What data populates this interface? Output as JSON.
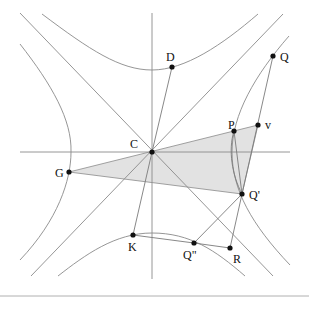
{
  "diagram": {
    "type": "conjugate hyperbolas with asymptotes and shaded triangle",
    "colors": {
      "background": "#ffffff",
      "lines": "#8a8a8a",
      "points": "#111111",
      "shaded_triangle": "#e2e2e2"
    },
    "points": [
      {
        "id": "C",
        "label": "C",
        "x": 152,
        "y": 152,
        "lx": 130,
        "ly": 148
      },
      {
        "id": "D",
        "label": "D",
        "x": 172,
        "y": 67,
        "lx": 166,
        "ly": 61
      },
      {
        "id": "Q",
        "label": "Q",
        "x": 273,
        "y": 56,
        "lx": 280,
        "ly": 61
      },
      {
        "id": "P",
        "label": "P",
        "x": 234,
        "y": 131,
        "lx": 228,
        "ly": 129
      },
      {
        "id": "v",
        "label": "v",
        "x": 258,
        "y": 125,
        "lx": 265,
        "ly": 129
      },
      {
        "id": "G",
        "label": "G",
        "x": 69,
        "y": 172,
        "lx": 55,
        "ly": 177
      },
      {
        "id": "Qprime",
        "label": "Q'",
        "x": 242,
        "y": 194,
        "lx": 249,
        "ly": 199
      },
      {
        "id": "K",
        "label": "K",
        "x": 133,
        "y": 235,
        "lx": 128,
        "ly": 251
      },
      {
        "id": "Qdouble",
        "label": "Q\"",
        "x": 194,
        "y": 243,
        "lx": 183,
        "ly": 259
      },
      {
        "id": "R",
        "label": "R",
        "x": 230,
        "y": 248,
        "lx": 233,
        "ly": 263
      }
    ],
    "shaded_triangle": [
      "G",
      "v",
      "Qprime"
    ]
  }
}
